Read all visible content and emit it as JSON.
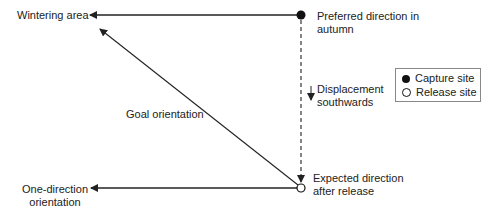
{
  "diagram": {
    "labels": {
      "wintering_area": "Wintering area",
      "preferred_direction_line1": "Preferred direction in",
      "preferred_direction_line2": "autumn",
      "displacement_line1": "Displacement",
      "displacement_line2": "southwards",
      "goal_orientation": "Goal orientation",
      "expected_direction_line1": "Expected direction",
      "expected_direction_line2": "after release",
      "one_direction_line1": "One-direction",
      "one_direction_line2": "orientation"
    },
    "legend": {
      "capture_site": "Capture site",
      "release_site": "Release site"
    },
    "colors": {
      "line": "#222222",
      "legend_border": "#888888"
    }
  }
}
